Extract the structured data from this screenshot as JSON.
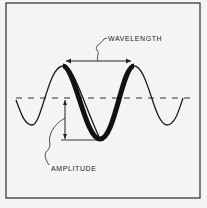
{
  "diagram": {
    "labels": {
      "wavelength": "WAVELENGTH",
      "amplitude": "AMPLITUDE"
    },
    "colors": {
      "background": "#f4f4f2",
      "ink": "#1a1a1a"
    }
  }
}
